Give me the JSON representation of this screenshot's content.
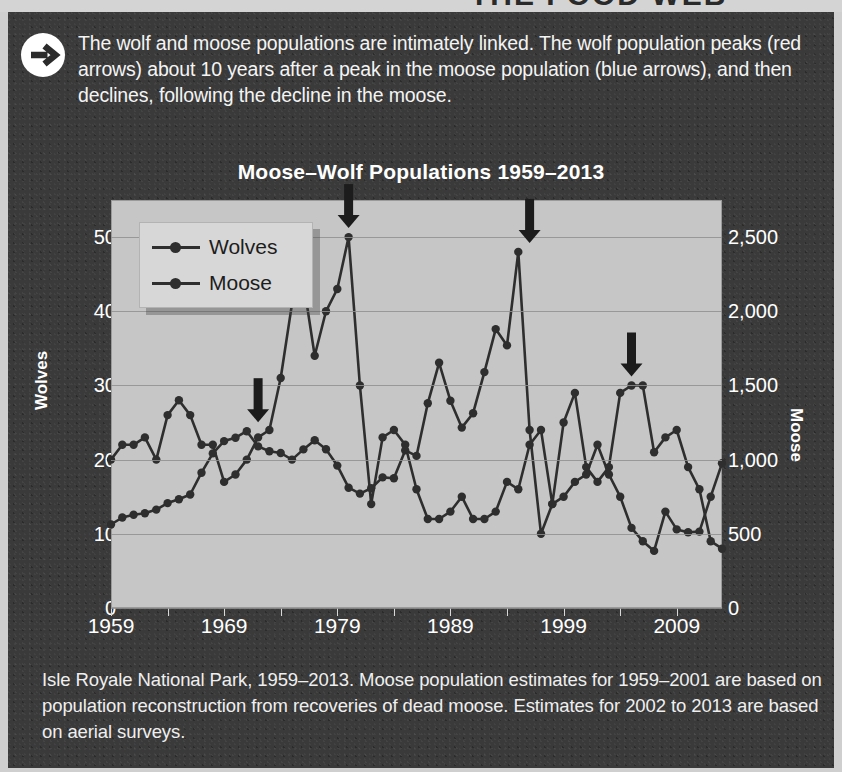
{
  "top_clipped_headline": "THE FOOD WEB",
  "callout": {
    "icon": "arrow-right-circle-icon",
    "text": "The wolf and moose populations are intimately linked. The wolf population peaks (red arrows) about 10 years after a peak in the moose population (blue arrows), and then declines, following the decline in the moose."
  },
  "chart_title": "Moose–Wolf Populations 1959–2013",
  "caption": "Isle Royale National Park, 1959–2013. Moose population estimates for 1959–2001 are based on population reconstruction from recoveries of dead moose. Estimates for 2002 to 2013 are based on aerial surveys.",
  "legend": {
    "items": [
      {
        "label": "Wolves",
        "marker": "line-dot-marker"
      },
      {
        "label": "Moose",
        "marker": "line-dot-marker"
      }
    ]
  },
  "colors": {
    "panel_bg": "#3a3a3a",
    "plot_bg": "#c6c6c6",
    "series": "#2e2e2e",
    "gridline": "#8f8f8f",
    "text_light": "#ffffff",
    "red_arrow_note": "#2b2b2b",
    "blue_arrow_note": "#2b2b2b"
  },
  "chart_data": {
    "type": "line",
    "title": "Moose–Wolf Populations 1959–2013",
    "xlabel": "",
    "ylabel": "Wolves",
    "ylabel_right": "Moose",
    "grid": true,
    "legend_position": "top-left",
    "xlim": [
      1959,
      2013
    ],
    "ylim": [
      0,
      55
    ],
    "ylim_right": [
      0,
      2750
    ],
    "xticks": [
      1959,
      1969,
      1979,
      1989,
      1999,
      2009
    ],
    "xtick_labels": [
      "1959",
      "1969",
      "1979",
      "1989",
      "1999",
      "2009"
    ],
    "yticks": [
      0,
      10,
      20,
      30,
      40,
      50
    ],
    "ytick_labels": [
      "0",
      "10",
      "20",
      "30",
      "40",
      "50"
    ],
    "yticks_right": [
      0,
      500,
      1000,
      1500,
      2000,
      2500
    ],
    "ytick_labels_right": [
      "0",
      "500",
      "1,000",
      "1,500",
      "2,000",
      "2,500"
    ],
    "x": [
      1959,
      1960,
      1961,
      1962,
      1963,
      1964,
      1965,
      1966,
      1967,
      1968,
      1969,
      1970,
      1971,
      1972,
      1973,
      1974,
      1975,
      1976,
      1977,
      1978,
      1979,
      1980,
      1981,
      1982,
      1983,
      1984,
      1985,
      1986,
      1987,
      1988,
      1989,
      1990,
      1991,
      1992,
      1993,
      1994,
      1995,
      1996,
      1997,
      1998,
      1999,
      2000,
      2001,
      2002,
      2003,
      2004,
      2005,
      2006,
      2007,
      2008,
      2009,
      2010,
      2011,
      2012,
      2013
    ],
    "series": [
      {
        "name": "Wolves",
        "axis": "left",
        "values": [
          20,
          22,
          22,
          23,
          20,
          26,
          28,
          26,
          22,
          22,
          17,
          18,
          20,
          23,
          24,
          31,
          41,
          44,
          34,
          40,
          43,
          50,
          30,
          14,
          23,
          24,
          22,
          16,
          12,
          12,
          13,
          15,
          12,
          12,
          13,
          17,
          16,
          22,
          24,
          14,
          25,
          29,
          19,
          17,
          19,
          29,
          30,
          30,
          21,
          23,
          24,
          19,
          16,
          9,
          8
        ]
      },
      {
        "name": "Moose",
        "axis": "right",
        "values": [
          563,
          610,
          628,
          639,
          663,
          707,
          733,
          765,
          912,
          1042,
          1125,
          1148,
          1192,
          1089,
          1057,
          1045,
          1000,
          1069,
          1130,
          1070,
          960,
          811,
          771,
          807,
          880,
          874,
          1062,
          1025,
          1380,
          1653,
          1397,
          1216,
          1313,
          1590,
          1880,
          1770,
          2400,
          1200,
          500,
          700,
          750,
          850,
          900,
          1100,
          900,
          750,
          540,
          450,
          385,
          650,
          530,
          510,
          515,
          750,
          975
        ]
      }
    ],
    "annotations": [
      {
        "type": "arrow",
        "label": "moose-peak-arrow",
        "color": "blue",
        "year": 1972,
        "series": "Moose",
        "value": 1192
      },
      {
        "type": "arrow",
        "label": "wolf-peak-arrow",
        "color": "red",
        "year": 1980,
        "series": "Wolves",
        "value": 50
      },
      {
        "type": "arrow",
        "label": "wolf-peak-arrow",
        "color": "red",
        "year": 1996,
        "series": "Wolves",
        "value": 48
      },
      {
        "type": "arrow",
        "label": "wolf-peak-arrow",
        "color": "red",
        "year": 2005,
        "series": "Wolves",
        "value": 30
      }
    ]
  }
}
